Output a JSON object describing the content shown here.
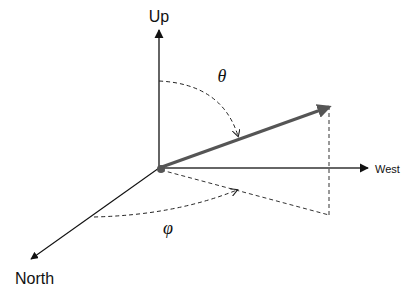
{
  "diagram": {
    "type": "3d-coordinate-system",
    "axes": [
      {
        "name": "up",
        "label": "Up"
      },
      {
        "name": "west",
        "label": "West"
      },
      {
        "name": "north",
        "label": "North"
      }
    ],
    "angles": {
      "polar": {
        "symbol": "θ"
      },
      "azimuth": {
        "symbol": "φ"
      }
    },
    "colors": {
      "axis": "#111111",
      "vector": "#555555",
      "dashed": "#333333",
      "origin": "#555555"
    }
  }
}
